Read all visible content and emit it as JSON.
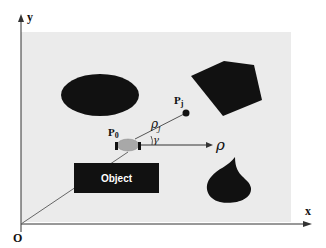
{
  "diagram": {
    "axes": {
      "x_label": "x",
      "y_label": "y",
      "origin_label": "O"
    },
    "points": {
      "robot_label": "P",
      "robot_subscript": "0",
      "target_label": "P",
      "target_subscript": "j"
    },
    "symbols": {
      "rho_j": "ρ",
      "rho_j_subscript": "j",
      "gamma": "γ",
      "rho_axis": "ρ"
    },
    "obstacles": [
      {
        "shape": "ellipse"
      },
      {
        "shape": "pentagon"
      },
      {
        "shape": "rectangle",
        "label": "Object"
      },
      {
        "shape": "teardrop"
      }
    ],
    "colors": {
      "region": "#ebebeb",
      "obstacle": "#111111",
      "robot": "#a8a8a8",
      "line": "#555555"
    }
  }
}
